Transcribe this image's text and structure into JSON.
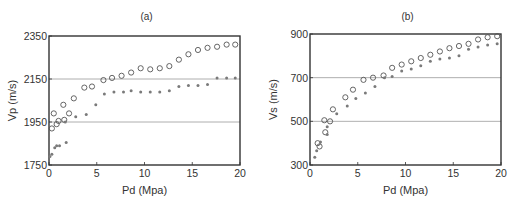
{
  "chart_data": [
    {
      "panel": "(a)",
      "type": "scatter",
      "title": "(a)",
      "xlabel": "Pd (Mpa)",
      "ylabel": "Vp (m/s)",
      "xlim": [
        0,
        20
      ],
      "ylim": [
        1750,
        2350
      ],
      "xticks": [
        0,
        5,
        10,
        15,
        20
      ],
      "yticks": [
        1750,
        1950,
        2150,
        2350
      ],
      "grid": "horizontal lines at 1950 and 2150",
      "legend": "none",
      "series": [
        {
          "name": "circles",
          "marker": "open-circle",
          "x": [
            0.3,
            0.5,
            0.8,
            1.0,
            1.5,
            1.6,
            2.1,
            2.6,
            3.7,
            4.5,
            5.7,
            6.6,
            7.6,
            8.6,
            9.6,
            10.6,
            11.6,
            12.6,
            13.6,
            14.6,
            15.6,
            16.6,
            17.6,
            18.6,
            19.5
          ],
          "y": [
            1920,
            1990,
            1940,
            1955,
            2030,
            1960,
            1990,
            2060,
            2110,
            2115,
            2145,
            2155,
            2165,
            2180,
            2200,
            2195,
            2200,
            2210,
            2240,
            2265,
            2285,
            2295,
            2300,
            2310,
            2310
          ]
        },
        {
          "name": "stars",
          "marker": "star",
          "x": [
            0.1,
            0.3,
            0.6,
            0.8,
            1.1,
            1.7,
            1.8,
            2.8,
            3.9,
            4.9,
            5.8,
            6.8,
            7.8,
            8.6,
            9.6,
            10.6,
            11.6,
            12.6,
            13.6,
            14.6,
            15.6,
            16.6,
            17.6,
            18.6,
            19.5
          ],
          "y": [
            1790,
            1800,
            1830,
            1840,
            1840,
            1950,
            1855,
            1975,
            1985,
            2030,
            2080,
            2090,
            2090,
            2095,
            2090,
            2090,
            2090,
            2095,
            2115,
            2120,
            2120,
            2125,
            2155,
            2155,
            2155
          ]
        }
      ]
    },
    {
      "panel": "(b)",
      "type": "scatter",
      "title": "(b)",
      "xlabel": "Pd (Mpa)",
      "ylabel": "Vs (m/s)",
      "xlim": [
        0,
        20
      ],
      "ylim": [
        300,
        900
      ],
      "xticks": [
        0,
        5,
        10,
        15,
        20
      ],
      "yticks": [
        300,
        500,
        700,
        900
      ],
      "grid": "horizontal lines at 500 and 700",
      "legend": "none",
      "series": [
        {
          "name": "circles",
          "marker": "open-circle",
          "x": [
            0.8,
            1.0,
            1.5,
            1.6,
            2.1,
            2.4,
            3.7,
            4.5,
            5.6,
            6.6,
            7.7,
            8.6,
            9.6,
            10.6,
            11.6,
            12.6,
            13.6,
            14.6,
            15.6,
            16.6,
            17.6,
            18.6,
            19.6
          ],
          "y": [
            400,
            385,
            505,
            450,
            500,
            555,
            610,
            645,
            690,
            700,
            710,
            745,
            760,
            775,
            790,
            805,
            820,
            835,
            845,
            855,
            875,
            885,
            890
          ]
        },
        {
          "name": "stars",
          "marker": "star",
          "x": [
            0.5,
            0.7,
            1.1,
            1.8,
            1.8,
            2.8,
            3.9,
            4.8,
            5.8,
            6.8,
            7.8,
            8.6,
            9.6,
            10.6,
            11.6,
            12.6,
            13.6,
            14.6,
            15.6,
            16.6,
            17.6,
            18.6,
            19.6
          ],
          "y": [
            335,
            365,
            405,
            440,
            475,
            535,
            570,
            605,
            630,
            660,
            700,
            705,
            730,
            740,
            755,
            775,
            785,
            790,
            800,
            830,
            840,
            850,
            855
          ]
        }
      ]
    }
  ],
  "layout": {
    "panels": [
      {
        "left": 49,
        "top": 36,
        "right": 240,
        "bottom": 165
      },
      {
        "left": 310,
        "top": 34,
        "right": 501,
        "bottom": 165
      }
    ],
    "colors": {
      "axis": "#333333",
      "grid": "#9a9a9a",
      "circle": "#555555",
      "star": "#7a7a7a"
    }
  }
}
